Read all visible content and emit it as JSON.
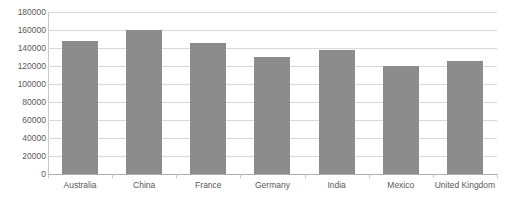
{
  "chart_data": {
    "type": "bar",
    "title": "",
    "xlabel": "",
    "ylabel": "",
    "categories": [
      "Australia",
      "China",
      "France",
      "Germany",
      "India",
      "Mexico",
      "United Kingdom"
    ],
    "values": [
      147800,
      160000,
      145500,
      130000,
      137800,
      120000,
      125500
    ],
    "ylim": [
      0,
      180000
    ],
    "ytick_step": 20000,
    "yticks": [
      0,
      20000,
      40000,
      60000,
      80000,
      100000,
      120000,
      140000,
      160000,
      180000
    ],
    "ytick_labels": [
      "0",
      "20000",
      "40000",
      "60000",
      "80000",
      "100000",
      "120000",
      "140000",
      "160000",
      "180000"
    ],
    "grid": true,
    "grid_axis": "y",
    "legend": false,
    "legend_position": "none",
    "series": [
      {
        "name": "",
        "color": "#8c8c8c",
        "values": [
          147800,
          160000,
          145500,
          130000,
          137800,
          120000,
          125500
        ]
      }
    ]
  },
  "colors": {
    "bar": "#8c8c8c",
    "gridline": "#d9d9d9",
    "axis": "#c8c8c8",
    "baseline": "#b0b0b0",
    "tick_text": "#595959",
    "background": "#ffffff"
  }
}
